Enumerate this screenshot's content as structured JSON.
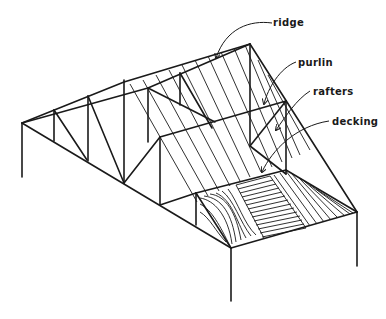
{
  "figure": {
    "labels": [
      {
        "id": "ridge",
        "text": "ridge"
      },
      {
        "id": "purlin",
        "text": "purlin"
      },
      {
        "id": "rafters",
        "text": "rafters"
      },
      {
        "id": "decking",
        "text": "decking"
      }
    ],
    "colors": {
      "line": "#1a1a1a",
      "background": "#ffffff"
    }
  }
}
